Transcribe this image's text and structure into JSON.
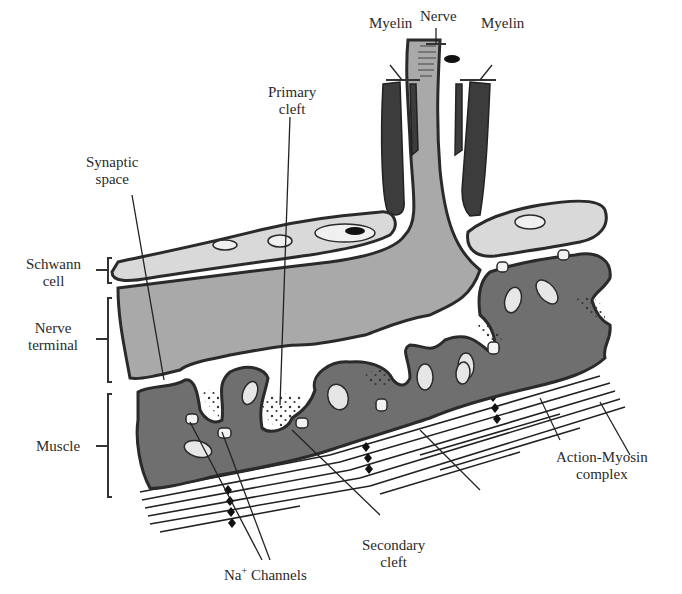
{
  "colors": {
    "outline": "#333333",
    "schwann_cell": "#d9d9d9",
    "nerve_terminal": "#a9a9a9",
    "muscle": "#6f6f6f",
    "myelin": "#3c3c3c",
    "background": "#ffffff",
    "label": "#2a2a2a"
  },
  "labels": {
    "nerve": "Nerve",
    "myelin_left": "Myelin",
    "myelin_right": "Myelin",
    "primary_cleft_1": "Primary",
    "primary_cleft_2": "cleft",
    "synaptic_space_1": "Synaptic",
    "synaptic_space_2": "space",
    "schwann_cell_1": "Schwann",
    "schwann_cell_2": "cell",
    "nerve_terminal_1": "Nerve",
    "nerve_terminal_2": "terminal",
    "muscle": "Muscle",
    "action_myosin_1": "Action-Myosin",
    "action_myosin_2": "complex",
    "na_channels_prefix": "Na",
    "na_channels_sup": "+",
    "na_channels_suffix": " Channels",
    "secondary_cleft_1": "Secondary",
    "secondary_cleft_2": "cleft"
  },
  "structures": [
    "Nerve",
    "Myelin",
    "Schwann cell",
    "Nerve terminal",
    "Synaptic space",
    "Primary cleft",
    "Secondary cleft",
    "Na+ Channels",
    "Muscle",
    "Action-Myosin complex"
  ]
}
